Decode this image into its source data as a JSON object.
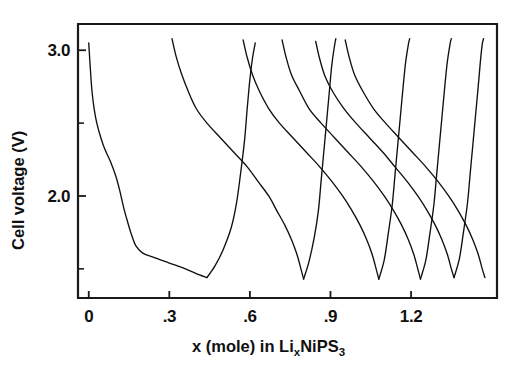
{
  "chart_data": {
    "type": "line",
    "title": "",
    "xlabel": "x (mole) in Li_xNiPS_3",
    "xlabel_parts": {
      "lead": "x (mole) in  Li",
      "sub1": "x",
      "mid": "NiPS",
      "sub2": "3"
    },
    "ylabel": "Cell voltage (V)",
    "xlim": [
      -0.04,
      1.52
    ],
    "ylim": [
      1.3,
      3.18
    ],
    "xticks": [
      0,
      0.3,
      0.6,
      0.9,
      1.2
    ],
    "xticklabels": [
      "0",
      ".3",
      ".6",
      ".9",
      "1.2"
    ],
    "yticks": [
      2.0,
      3.0
    ],
    "yticklabels": [
      "2.0",
      "3.0"
    ],
    "yticks_minor": [
      1.5,
      2.5
    ],
    "grid": false,
    "legend": false,
    "line_color": "#101010",
    "axis_color": "#1a1a1a",
    "background": "#ffffff",
    "series": [
      {
        "name": "initial-discharge",
        "points": [
          [
            0.0,
            3.05
          ],
          [
            0.005,
            2.9
          ],
          [
            0.012,
            2.72
          ],
          [
            0.02,
            2.6
          ],
          [
            0.03,
            2.5
          ],
          [
            0.045,
            2.4
          ],
          [
            0.06,
            2.32
          ],
          [
            0.08,
            2.24
          ],
          [
            0.1,
            2.14
          ],
          [
            0.115,
            2.04
          ],
          [
            0.13,
            1.92
          ],
          [
            0.145,
            1.82
          ],
          [
            0.16,
            1.73
          ],
          [
            0.175,
            1.66
          ],
          [
            0.2,
            1.61
          ],
          [
            0.24,
            1.58
          ],
          [
            0.3,
            1.54
          ],
          [
            0.36,
            1.5
          ],
          [
            0.41,
            1.46
          ],
          [
            0.44,
            1.44
          ]
        ]
      },
      {
        "name": "charge-1",
        "points": [
          [
            0.44,
            1.44
          ],
          [
            0.47,
            1.52
          ],
          [
            0.5,
            1.63
          ],
          [
            0.53,
            1.78
          ],
          [
            0.55,
            1.95
          ],
          [
            0.565,
            2.15
          ],
          [
            0.58,
            2.38
          ],
          [
            0.59,
            2.6
          ],
          [
            0.6,
            2.8
          ],
          [
            0.61,
            2.95
          ],
          [
            0.62,
            3.05
          ]
        ]
      },
      {
        "name": "discharge-2",
        "points": [
          [
            0.31,
            3.08
          ],
          [
            0.325,
            2.96
          ],
          [
            0.345,
            2.84
          ],
          [
            0.37,
            2.72
          ],
          [
            0.4,
            2.6
          ],
          [
            0.44,
            2.5
          ],
          [
            0.49,
            2.4
          ],
          [
            0.54,
            2.3
          ],
          [
            0.59,
            2.2
          ],
          [
            0.63,
            2.1
          ],
          [
            0.67,
            2.0
          ],
          [
            0.7,
            1.9
          ],
          [
            0.73,
            1.8
          ],
          [
            0.755,
            1.7
          ],
          [
            0.775,
            1.6
          ],
          [
            0.79,
            1.5
          ],
          [
            0.8,
            1.43
          ]
        ]
      },
      {
        "name": "charge-2",
        "points": [
          [
            0.8,
            1.43
          ],
          [
            0.82,
            1.55
          ],
          [
            0.84,
            1.72
          ],
          [
            0.855,
            1.9
          ],
          [
            0.865,
            2.1
          ],
          [
            0.875,
            2.3
          ],
          [
            0.885,
            2.5
          ],
          [
            0.895,
            2.7
          ],
          [
            0.905,
            2.9
          ],
          [
            0.915,
            3.03
          ],
          [
            0.92,
            3.08
          ]
        ]
      },
      {
        "name": "discharge-3",
        "points": [
          [
            0.575,
            3.07
          ],
          [
            0.59,
            2.95
          ],
          [
            0.61,
            2.83
          ],
          [
            0.635,
            2.72
          ],
          [
            0.67,
            2.6
          ],
          [
            0.71,
            2.5
          ],
          [
            0.76,
            2.4
          ],
          [
            0.81,
            2.3
          ],
          [
            0.86,
            2.2
          ],
          [
            0.905,
            2.1
          ],
          [
            0.945,
            2.0
          ],
          [
            0.98,
            1.9
          ],
          [
            1.01,
            1.8
          ],
          [
            1.035,
            1.7
          ],
          [
            1.055,
            1.6
          ],
          [
            1.07,
            1.5
          ],
          [
            1.08,
            1.43
          ]
        ]
      },
      {
        "name": "charge-3",
        "points": [
          [
            1.08,
            1.43
          ],
          [
            1.1,
            1.56
          ],
          [
            1.115,
            1.74
          ],
          [
            1.13,
            1.94
          ],
          [
            1.14,
            2.14
          ],
          [
            1.15,
            2.34
          ],
          [
            1.16,
            2.54
          ],
          [
            1.17,
            2.74
          ],
          [
            1.18,
            2.92
          ],
          [
            1.19,
            3.04
          ],
          [
            1.195,
            3.08
          ]
        ]
      },
      {
        "name": "discharge-4",
        "points": [
          [
            0.72,
            3.07
          ],
          [
            0.735,
            2.95
          ],
          [
            0.755,
            2.83
          ],
          [
            0.785,
            2.72
          ],
          [
            0.82,
            2.6
          ],
          [
            0.865,
            2.5
          ],
          [
            0.915,
            2.4
          ],
          [
            0.965,
            2.3
          ],
          [
            1.015,
            2.2
          ],
          [
            1.06,
            2.1
          ],
          [
            1.1,
            2.0
          ],
          [
            1.135,
            1.9
          ],
          [
            1.165,
            1.8
          ],
          [
            1.19,
            1.7
          ],
          [
            1.21,
            1.6
          ],
          [
            1.225,
            1.5
          ],
          [
            1.235,
            1.43
          ]
        ]
      },
      {
        "name": "charge-4",
        "points": [
          [
            1.235,
            1.43
          ],
          [
            1.255,
            1.56
          ],
          [
            1.27,
            1.74
          ],
          [
            1.285,
            1.94
          ],
          [
            1.295,
            2.14
          ],
          [
            1.305,
            2.34
          ],
          [
            1.315,
            2.54
          ],
          [
            1.325,
            2.74
          ],
          [
            1.335,
            2.92
          ],
          [
            1.345,
            3.04
          ],
          [
            1.35,
            3.08
          ]
        ]
      },
      {
        "name": "discharge-5",
        "points": [
          [
            0.845,
            3.06
          ],
          [
            0.86,
            2.94
          ],
          [
            0.88,
            2.82
          ],
          [
            0.91,
            2.71
          ],
          [
            0.95,
            2.6
          ],
          [
            0.995,
            2.5
          ],
          [
            1.045,
            2.4
          ],
          [
            1.095,
            2.3
          ],
          [
            1.14,
            2.2
          ],
          [
            1.185,
            2.1
          ],
          [
            1.225,
            2.0
          ],
          [
            1.26,
            1.9
          ],
          [
            1.29,
            1.8
          ],
          [
            1.315,
            1.7
          ],
          [
            1.335,
            1.6
          ],
          [
            1.35,
            1.5
          ],
          [
            1.36,
            1.44
          ]
        ]
      },
      {
        "name": "charge-5",
        "points": [
          [
            1.36,
            1.44
          ],
          [
            1.38,
            1.57
          ],
          [
            1.395,
            1.75
          ],
          [
            1.41,
            1.95
          ],
          [
            1.42,
            2.15
          ],
          [
            1.43,
            2.35
          ],
          [
            1.44,
            2.55
          ],
          [
            1.45,
            2.75
          ],
          [
            1.458,
            2.92
          ],
          [
            1.465,
            3.04
          ],
          [
            1.47,
            3.08
          ]
        ]
      },
      {
        "name": "discharge-6",
        "points": [
          [
            0.955,
            3.07
          ],
          [
            0.97,
            2.95
          ],
          [
            0.99,
            2.83
          ],
          [
            1.02,
            2.72
          ],
          [
            1.06,
            2.6
          ],
          [
            1.105,
            2.5
          ],
          [
            1.155,
            2.4
          ],
          [
            1.205,
            2.3
          ],
          [
            1.255,
            2.2
          ],
          [
            1.3,
            2.1
          ],
          [
            1.34,
            2.0
          ],
          [
            1.375,
            1.9
          ],
          [
            1.405,
            1.8
          ],
          [
            1.43,
            1.7
          ],
          [
            1.45,
            1.6
          ],
          [
            1.465,
            1.5
          ],
          [
            1.475,
            1.44
          ]
        ]
      }
    ]
  }
}
